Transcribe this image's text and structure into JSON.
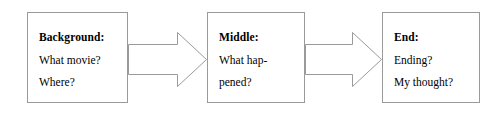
{
  "diagram": {
    "type": "three-stage-flow",
    "boxes": [
      {
        "id": "background",
        "heading": "Background:",
        "lines": [
          "What movie?",
          "Where?"
        ],
        "x": 27,
        "y": 12,
        "width": 101,
        "height": 91
      },
      {
        "id": "middle",
        "heading": "Middle:",
        "lines": [
          "What hap-",
          "pened?"
        ],
        "x": 207,
        "y": 12,
        "width": 98,
        "height": 91
      },
      {
        "id": "end",
        "heading": "End:",
        "lines": [
          "Ending?",
          "My thought?"
        ],
        "x": 382,
        "y": 12,
        "width": 98,
        "height": 91
      }
    ],
    "arrows": [
      {
        "id": "arrow-background-to-middle",
        "from": "background",
        "to": "middle",
        "x": 128,
        "y": 32,
        "width": 79,
        "height": 55
      },
      {
        "id": "arrow-middle-to-end",
        "from": "middle",
        "to": "end",
        "x": 305,
        "y": 32,
        "width": 77,
        "height": 55
      }
    ],
    "colors": {
      "box_border": "#9a9a9a",
      "arrow_stroke": "#9a9a9a",
      "arrow_fill": "#ffffff",
      "text": "#000000",
      "background": "#ffffff"
    }
  }
}
